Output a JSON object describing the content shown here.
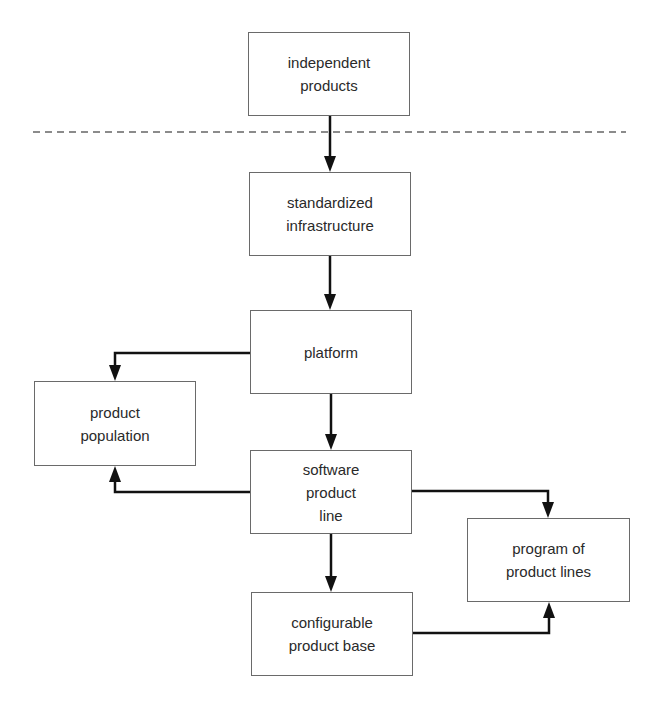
{
  "diagram": {
    "type": "flowchart",
    "colors": {
      "background": "#ffffff",
      "node_border": "#6a6a6a",
      "text": "#2a2a2a",
      "arrow": "#111111",
      "separator": "#666666"
    },
    "separator": {
      "style": "dashed",
      "y": 132,
      "x_start": 33,
      "x_end": 626
    },
    "nodes": [
      {
        "id": "independent_products",
        "label": "independent\nproducts",
        "x": 248,
        "y": 32,
        "w": 162,
        "h": 84
      },
      {
        "id": "standardized_infrastructure",
        "label": "standardized\ninfrastructure",
        "x": 249,
        "y": 172,
        "w": 162,
        "h": 84
      },
      {
        "id": "platform",
        "label": "platform",
        "x": 250,
        "y": 310,
        "w": 162,
        "h": 84
      },
      {
        "id": "product_population",
        "label": "product\npopulation",
        "x": 34,
        "y": 381,
        "w": 162,
        "h": 85
      },
      {
        "id": "software_product_line",
        "label": "software\nproduct\nline",
        "x": 250,
        "y": 450,
        "w": 162,
        "h": 84
      },
      {
        "id": "program_of_product_lines",
        "label": "program of\nproduct lines",
        "x": 467,
        "y": 518,
        "w": 163,
        "h": 84
      },
      {
        "id": "configurable_product_base",
        "label": "configurable\nproduct base",
        "x": 251,
        "y": 592,
        "w": 162,
        "h": 84
      }
    ],
    "edges": [
      {
        "from": "independent_products",
        "to": "standardized_infrastructure"
      },
      {
        "from": "standardized_infrastructure",
        "to": "platform"
      },
      {
        "from": "platform",
        "to": "software_product_line"
      },
      {
        "from": "platform",
        "to": "product_population"
      },
      {
        "from": "software_product_line",
        "to": "product_population"
      },
      {
        "from": "software_product_line",
        "to": "configurable_product_base"
      },
      {
        "from": "software_product_line",
        "to": "program_of_product_lines"
      },
      {
        "from": "configurable_product_base",
        "to": "program_of_product_lines"
      }
    ]
  }
}
